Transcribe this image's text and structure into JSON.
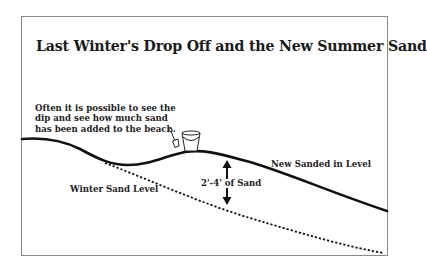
{
  "title": "Last Winter's Drop Off and the New Summer Sand",
  "note": {
    "lines": [
      "Often it is possible to see the",
      "dip and see how much sand",
      "has been added to the beach."
    ]
  },
  "labels": {
    "new_level": "New Sanded in Level",
    "winter_level": "Winter Sand Level",
    "depth": "2'-4' of Sand"
  },
  "icons": {
    "shovel": "shovel-icon",
    "bucket": "bucket-icon",
    "arrow_up": "arrow-up-icon",
    "arrow_down": "arrow-down-icon"
  },
  "colors": {
    "line": "#111111",
    "frame": "#8a8a8a",
    "text": "#222222"
  }
}
